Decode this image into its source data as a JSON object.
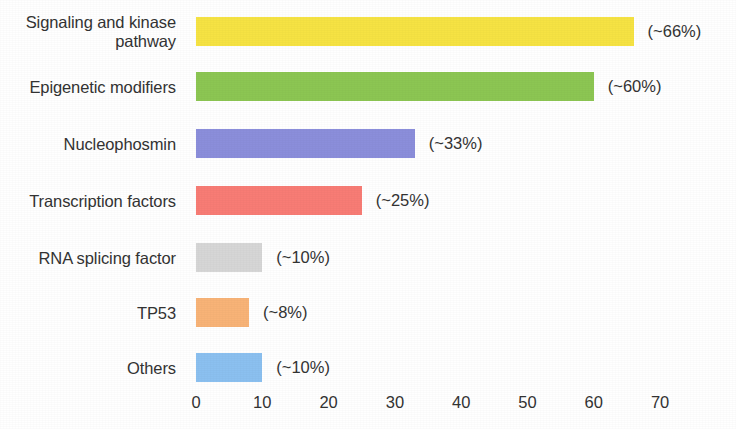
{
  "chart_data": {
    "type": "bar",
    "orientation": "horizontal",
    "title": "",
    "subtitle": "",
    "xlabel": "",
    "ylabel": "",
    "xlim": [
      0,
      73
    ],
    "xticks": [
      0,
      10,
      20,
      30,
      40,
      50,
      60,
      70
    ],
    "xtick_labels": [
      "0",
      "10",
      "20",
      "30",
      "40",
      "50",
      "60",
      "70"
    ],
    "grid": false,
    "legend": "none",
    "categories": [
      "Signaling and kinase\npathway",
      "Epigenetic modifiers",
      "Nucleophosmin",
      "Transcription factors",
      "RNA splicing factor",
      "TP53",
      "Others"
    ],
    "values": [
      66,
      60,
      33,
      25,
      10,
      8,
      10
    ],
    "value_labels": [
      "(~66%)",
      "(~60%)",
      "(~33%)",
      "(~25%)",
      "(~10%)",
      "(~8%)",
      "(~10%)"
    ],
    "colors": [
      "#f6e343",
      "#8cc653",
      "#8b8edb",
      "#f87c75",
      "#d6d6d6",
      "#f8b377",
      "#8bc0f0"
    ],
    "bars": [
      {
        "label": "Signaling and kinase\npathway",
        "value": 66,
        "value_label": "(~66%)",
        "color": "#f6e343",
        "color_name": "yellow"
      },
      {
        "label": "Epigenetic modifiers",
        "value": 60,
        "value_label": "(~60%)",
        "color": "#8cc653",
        "color_name": "green"
      },
      {
        "label": "Nucleophosmin",
        "value": 33,
        "value_label": "(~33%)",
        "color": "#8b8edb",
        "color_name": "periwinkle"
      },
      {
        "label": "Transcription factors",
        "value": 25,
        "value_label": "(~25%)",
        "color": "#f87c75",
        "color_name": "salmon"
      },
      {
        "label": "RNA splicing factor",
        "value": 10,
        "value_label": "(~10%)",
        "color": "#d6d6d6",
        "color_name": "grey"
      },
      {
        "label": "TP53",
        "value": 8,
        "value_label": "(~8%)",
        "color": "#f8b377",
        "color_name": "orange"
      },
      {
        "label": "Others",
        "value": 10,
        "value_label": "(~10%)",
        "color": "#8bc0f0",
        "color_name": "light-blue"
      }
    ]
  }
}
